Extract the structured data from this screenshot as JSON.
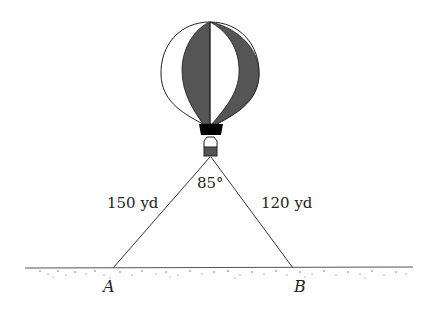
{
  "diagram": {
    "angle_label": "85°",
    "side_left_label": "150 yd",
    "side_right_label": "120 yd",
    "point_a_label": "A",
    "point_b_label": "B",
    "colors": {
      "balloon_dark": "#555555",
      "outline": "#222222",
      "basket": "#000000"
    }
  }
}
